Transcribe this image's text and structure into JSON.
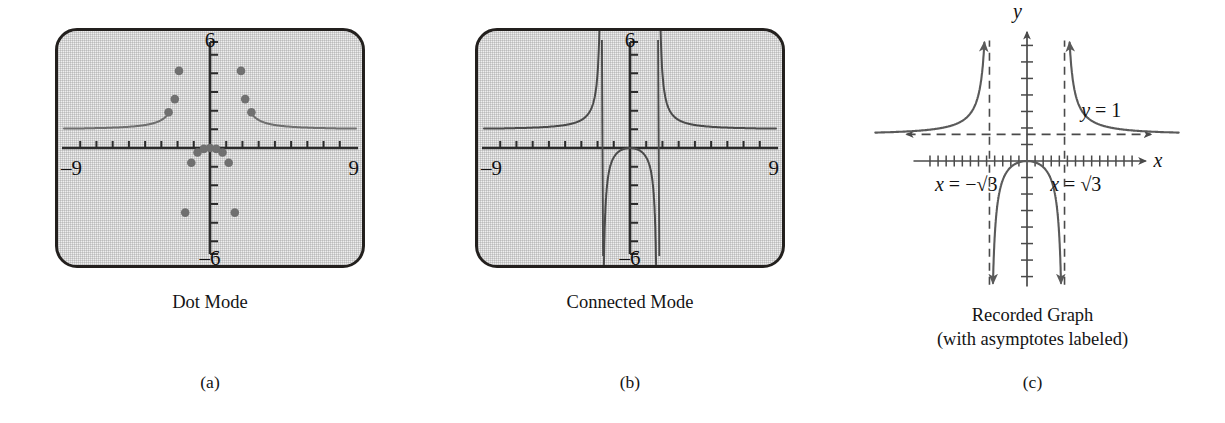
{
  "figure": {
    "background": "#ffffff",
    "ink_color": "#1a1a1a"
  },
  "panels": [
    {
      "id": "a",
      "letter": "(a)",
      "caption": "Dot Mode",
      "type": "calculator-screen",
      "screen": {
        "style": "graphing-calculator",
        "border_color": "#23201e",
        "fill_color": "#eeeeee",
        "labels": {
          "top": "6",
          "bottom": "–6",
          "left": "–9",
          "right": "9"
        },
        "window": {
          "xmin": -9,
          "xmax": 9,
          "ymin": -6,
          "ymax": 6
        },
        "x_tick_step": 1,
        "y_tick_step": 1
      },
      "plot_mode": "dot",
      "dot_color": "#6a6a6a",
      "curve_color": "#6a6a6a"
    },
    {
      "id": "b",
      "letter": "(b)",
      "caption": "Connected Mode",
      "type": "calculator-screen",
      "screen": {
        "style": "graphing-calculator",
        "border_color": "#23201e",
        "fill_color": "#eeeeee",
        "labels": {
          "top": "6",
          "bottom": "–6",
          "left": "–9",
          "right": "9"
        },
        "window": {
          "xmin": -9,
          "xmax": 9,
          "ymin": -6,
          "ymax": 6
        },
        "x_tick_step": 1,
        "y_tick_step": 1
      },
      "plot_mode": "connected",
      "curve_color": "#4a4a4a",
      "note_visible_artifact": "near-vertical segments drawn at x = ±√3"
    },
    {
      "id": "c",
      "letter": "(c)",
      "caption_line1": "Recorded Graph",
      "caption_line2": "(with asymptotes labeled)",
      "type": "hand-drawn-graph",
      "axis_labels": {
        "x": "x",
        "y": "y"
      },
      "annotations": [
        {
          "name": "horizontal-asymptote-label",
          "text": "y = 1"
        },
        {
          "name": "left-vertical-asymptote-label",
          "text": "x = −√3"
        },
        {
          "name": "right-vertical-asymptote-label",
          "text": "x = √3"
        }
      ],
      "x_tick_count": 20,
      "y_tick_count": 14,
      "curve_color": "#555555",
      "asymptote_color": "#4a4a4a"
    }
  ],
  "chart_data": {
    "type": "line",
    "xlabel": "x",
    "ylabel": "y",
    "function": "x^2/(x^2-3)",
    "xlim": [
      -9,
      9
    ],
    "ylim": [
      -6,
      6
    ],
    "grid": false,
    "legend": "none",
    "asymptotes": {
      "vertical": [
        -1.732,
        1.732
      ],
      "vertical_labels": [
        "x = −√3",
        "x = √3"
      ],
      "horizontal": [
        1
      ],
      "horizontal_labels": [
        "y = 1"
      ]
    },
    "dot_mode_points": [
      {
        "x": -2.55,
        "y": 1.92
      },
      {
        "x": -2.17,
        "y": 2.62
      },
      {
        "x": -1.91,
        "y": 4.13
      },
      {
        "x": -1.53,
        "y": -3.46
      },
      {
        "x": -1.15,
        "y": -0.79
      },
      {
        "x": -0.77,
        "y": -0.24
      },
      {
        "x": -0.38,
        "y": -0.05
      },
      {
        "x": 0.0,
        "y": 0.0
      },
      {
        "x": 0.38,
        "y": -0.05
      },
      {
        "x": 0.77,
        "y": -0.24
      },
      {
        "x": 1.15,
        "y": -0.79
      },
      {
        "x": 1.53,
        "y": -3.46
      },
      {
        "x": 1.91,
        "y": 4.13
      },
      {
        "x": 2.17,
        "y": 2.62
      },
      {
        "x": 2.55,
        "y": 1.92
      }
    ],
    "branches": [
      {
        "name": "left-branch",
        "domain": [
          -9,
          -1.732
        ],
        "behavior": "decreasing from +inf at x=-√3 toward y=1 as x→-9"
      },
      {
        "name": "middle-branch",
        "domain": [
          -1.732,
          1.732
        ],
        "behavior": "maximum y=0 at x=0, → -inf at x=±√3"
      },
      {
        "name": "right-branch",
        "domain": [
          1.732,
          9
        ],
        "behavior": "decreasing from +inf at x=√3 toward y=1 as x→9"
      }
    ]
  }
}
